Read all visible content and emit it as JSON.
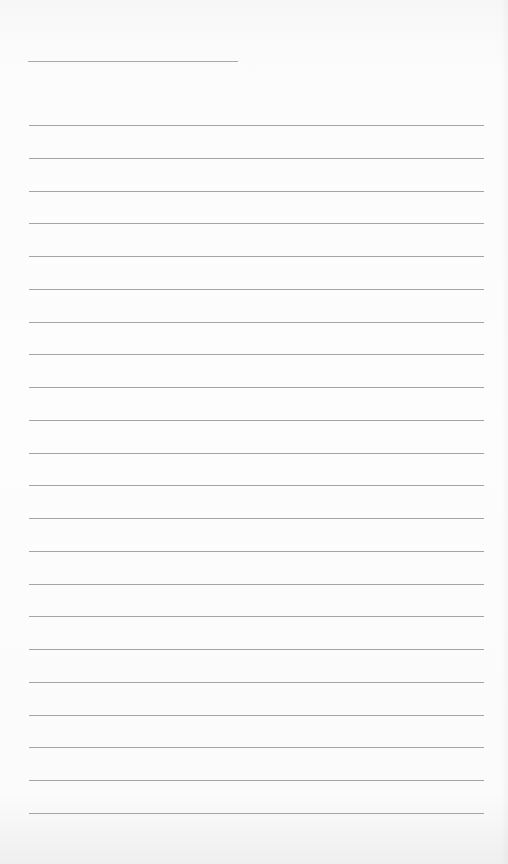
{
  "document": {
    "type": "lined-paper",
    "title_line": {
      "present": true,
      "text": ""
    },
    "line_count": 22,
    "line_color": "#a4a4a4",
    "background_color": "#fdfdfd",
    "lines": [
      "",
      "",
      "",
      "",
      "",
      "",
      "",
      "",
      "",
      "",
      "",
      "",
      "",
      "",
      "",
      "",
      "",
      "",
      "",
      "",
      "",
      ""
    ]
  }
}
